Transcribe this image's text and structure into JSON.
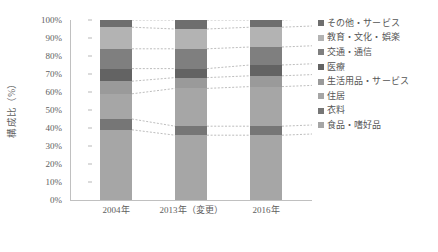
{
  "chart_data": {
    "type": "bar",
    "stacked": true,
    "normalized": "100%",
    "title": "",
    "xlabel": "",
    "ylabel": "構成比（%）",
    "ylim": [
      0,
      100
    ],
    "ytick_labels": [
      "0%",
      "10%",
      "20%",
      "30%",
      "40%",
      "50%",
      "60%",
      "70%",
      "80%",
      "90%",
      "100%"
    ],
    "ytick_values": [
      0,
      10,
      20,
      30,
      40,
      50,
      60,
      70,
      80,
      90,
      100
    ],
    "grid": false,
    "legend_position": "right",
    "categories": [
      "2004年",
      "2013年（変更）",
      "2016年"
    ],
    "series": [
      {
        "name": "食品・嗜好品",
        "color": "#a6a6a6",
        "values": [
          39,
          36,
          36
        ]
      },
      {
        "name": "衣料",
        "color": "#767676",
        "values": [
          6,
          5,
          5
        ]
      },
      {
        "name": "住居",
        "color": "#a6a6a6",
        "values": [
          14,
          21,
          22
        ]
      },
      {
        "name": "生活用品・サービス",
        "color": "#9a9a9a",
        "values": [
          7,
          6,
          6
        ]
      },
      {
        "name": "医療",
        "color": "#636363",
        "values": [
          7,
          5,
          6
        ]
      },
      {
        "name": "交通・通信",
        "color": "#7f7f7f",
        "values": [
          11,
          11,
          10
        ]
      },
      {
        "name": "教育・文化・娯楽",
        "color": "#b3b3b3",
        "values": [
          12,
          11,
          11
        ]
      },
      {
        "name": "その他・サービス",
        "color": "#6e6e6e",
        "values": [
          4,
          5,
          4
        ]
      }
    ],
    "legend_entries": [
      {
        "label": "その他・サービス",
        "color": "#6e6e6e"
      },
      {
        "label": "教育・文化・娯楽",
        "color": "#b3b3b3"
      },
      {
        "label": "交通・通信",
        "color": "#7f7f7f"
      },
      {
        "label": "医療",
        "color": "#636363"
      },
      {
        "label": "生活用品・サービス",
        "color": "#9a9a9a"
      },
      {
        "label": "住居",
        "color": "#a6a6a6"
      },
      {
        "label": "衣料",
        "color": "#767676"
      },
      {
        "label": "食品・嗜好品",
        "color": "#a6a6a6"
      }
    ],
    "connector_color": "#b5b5b5",
    "connector_style": "dotted"
  }
}
